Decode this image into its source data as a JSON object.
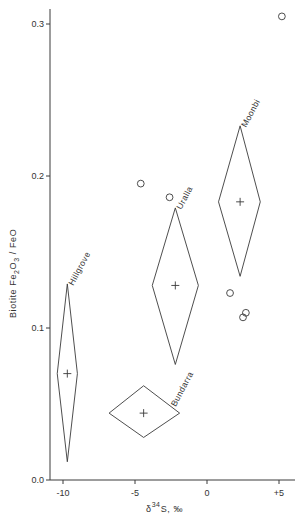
{
  "chart_data": {
    "type": "scatter",
    "title": "",
    "xlabel": "δ34S, ‰",
    "xlabel_parts": {
      "delta": "δ",
      "sup": "34",
      "rest": "S, ‰"
    },
    "ylabel": "Biotite Fe2O3 / FeO",
    "ylabel_parts": {
      "pre": "Biotite Fe",
      "sub1": "2",
      "mid": "O",
      "sub2": "3",
      "post": " / FeO"
    },
    "xlim": [
      -11,
      6
    ],
    "ylim": [
      0.0,
      0.315
    ],
    "x_ticks": [
      -10,
      -5,
      0,
      5
    ],
    "x_tick_labels": [
      "-10",
      "-5",
      "0",
      "+5"
    ],
    "y_ticks": [
      0.0,
      0.1,
      0.2,
      0.3
    ],
    "y_tick_labels": [
      "0.0",
      "0.1",
      "0.2",
      "0.3"
    ],
    "grid": false,
    "legend": null,
    "series": [
      {
        "name": "individual samples",
        "marker": "open-circle",
        "points": [
          {
            "x": -4.6,
            "y": 0.195
          },
          {
            "x": -2.6,
            "y": 0.186
          },
          {
            "x": 5.2,
            "y": 0.305
          },
          {
            "x": 1.6,
            "y": 0.123
          },
          {
            "x": 2.7,
            "y": 0.11
          },
          {
            "x": 2.5,
            "y": 0.107
          }
        ]
      },
      {
        "name": "granite suites (mean + range diamonds)",
        "marker": "cross-in-diamond",
        "groups": [
          {
            "label": "Hillgrove",
            "x": -9.7,
            "y": 0.07,
            "x_min": -10.4,
            "x_max": -9.0,
            "y_min": 0.012,
            "y_max": 0.129
          },
          {
            "label": "Bundarra",
            "x": -4.4,
            "y": 0.044,
            "x_min": -6.8,
            "x_max": -1.9,
            "y_min": 0.028,
            "y_max": 0.062
          },
          {
            "label": "Uralla",
            "x": -2.2,
            "y": 0.128,
            "x_min": -3.8,
            "x_max": -0.6,
            "y_min": 0.076,
            "y_max": 0.179
          },
          {
            "label": "Moonbi",
            "x": 2.3,
            "y": 0.183,
            "x_min": 0.8,
            "x_max": 3.7,
            "y_min": 0.134,
            "y_max": 0.233
          }
        ]
      }
    ]
  },
  "style": {
    "line_color": "#3a3a3a",
    "background": "#ffffff"
  }
}
